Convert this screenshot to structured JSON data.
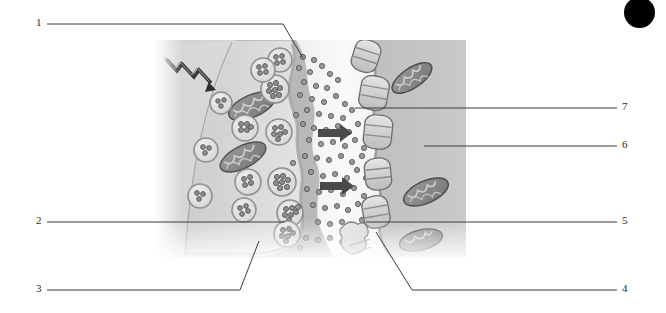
{
  "figure": {
    "style": "grayscale biological illustration",
    "background_color": "#ffffff",
    "ink_color": "#2b2b2b"
  },
  "corner_marker": {
    "name": "black-registration-dot",
    "color": "#000000",
    "x": 624,
    "y": -3,
    "diameter": 31
  },
  "illustration": {
    "x": 156,
    "y": 40,
    "width": 310,
    "height": 218,
    "regions": [
      {
        "name": "presynaptic-terminal",
        "fill": "#cfcfcf"
      },
      {
        "name": "synaptic-cleft",
        "fill": "#f2f2f2"
      },
      {
        "name": "postsynaptic-cell",
        "fill": "#b9b9b9"
      }
    ],
    "elements": [
      {
        "name": "action-potential-zigzag-arrow",
        "count": 1
      },
      {
        "name": "mitochondrion-presynaptic",
        "count": 2
      },
      {
        "name": "mitochondrion-postsynaptic",
        "count": 3
      },
      {
        "name": "synaptic-vesicle",
        "count": 12
      },
      {
        "name": "neurotransmitter-granule",
        "count": 70
      },
      {
        "name": "postsynaptic-receptor",
        "count": 6
      },
      {
        "name": "diffusion-arrow",
        "count": 2
      }
    ]
  },
  "labels": [
    {
      "id": "1",
      "text": "1",
      "side": "left",
      "num_x": 36,
      "num_y": 17,
      "path": "M 47 24 L 283 24 L 303 58"
    },
    {
      "id": "2",
      "text": "2",
      "side": "left",
      "num_x": 36,
      "num_y": 215,
      "path": "M 47 222 L 285 222"
    },
    {
      "id": "3",
      "text": "3",
      "side": "left",
      "num_x": 36,
      "num_y": 283,
      "path": "M 47 290 L 240 290 L 259 241"
    },
    {
      "id": "4",
      "text": "4",
      "side": "right",
      "num_x": 622,
      "num_y": 283,
      "path": "M 617 290 L 412 290 L 376 232"
    },
    {
      "id": "5",
      "text": "5",
      "side": "right",
      "num_x": 622,
      "num_y": 215,
      "path": "M 617 222 L 366 222"
    },
    {
      "id": "6",
      "text": "6",
      "side": "right",
      "num_x": 622,
      "num_y": 139,
      "path": "M 617 146 L 424 146"
    },
    {
      "id": "7",
      "text": "7",
      "side": "right",
      "num_x": 622,
      "num_y": 101,
      "path": "M 617 108 L 355 108"
    }
  ]
}
